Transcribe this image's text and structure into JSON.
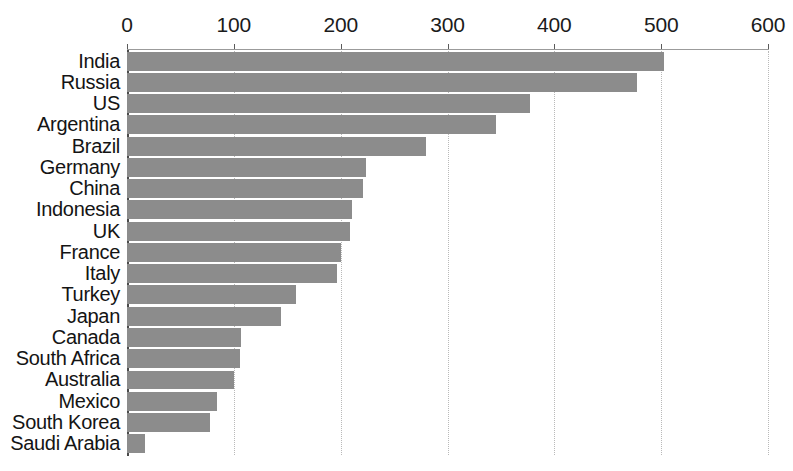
{
  "chart_data": {
    "type": "bar",
    "orientation": "horizontal",
    "title": "",
    "subtitle": "",
    "xlabel": "",
    "ylabel": "",
    "categories": [
      "India",
      "Russia",
      "US",
      "Argentina",
      "Brazil",
      "Germany",
      "China",
      "Indonesia",
      "UK",
      "France",
      "Italy",
      "Turkey",
      "Japan",
      "Canada",
      "South Africa",
      "Australia",
      "Mexico",
      "South Korea",
      "Saudi Arabia"
    ],
    "values": [
      503,
      477,
      377,
      345,
      280,
      224,
      221,
      211,
      209,
      200,
      197,
      158,
      144,
      107,
      106,
      100,
      84,
      78,
      17
    ],
    "xlim": [
      0,
      600
    ],
    "ylim": null,
    "x_ticks": [
      0,
      100,
      200,
      300,
      400,
      500,
      600
    ],
    "x_tick_labels": [
      "0",
      "100",
      "200",
      "300",
      "400",
      "500",
      "600"
    ],
    "grid": true,
    "grid_axis": "x",
    "grid_style": "dotted",
    "legend": false,
    "legend_position": "none",
    "bar_color": "#8c8c8c",
    "axis_color": "#4a4a4a",
    "gridline_color": "#b9b9b9",
    "text_color": "#141414",
    "background": "#ffffff",
    "annotations": []
  }
}
